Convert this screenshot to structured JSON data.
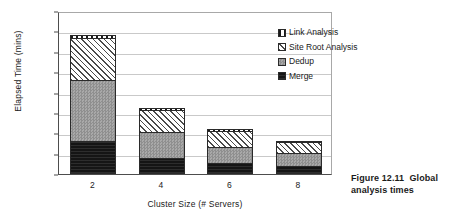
{
  "chart_data": {
    "type": "bar",
    "subtype": "stacked-bar",
    "title": "",
    "xlabel": "Cluster Size (# Servers)",
    "ylabel": "Elapsed Time (mins)",
    "categories": [
      "2",
      "4",
      "6",
      "8"
    ],
    "ylim": [
      0,
      400
    ],
    "yticks": [
      0,
      50,
      100,
      150,
      200,
      250,
      300,
      350,
      400
    ],
    "grid": true,
    "legend_position": "top-right-inside",
    "series": [
      {
        "name": "Merge",
        "values": [
          80,
          40,
          27,
          20
        ],
        "pattern": "solid-black",
        "color": "#151515"
      },
      {
        "name": "Dedup",
        "values": [
          151,
          63,
          40,
          32
        ],
        "pattern": "checker-gray",
        "color": "#9a9a9a"
      },
      {
        "name": "Site Root Analysis",
        "values": [
          102,
          55,
          38,
          26
        ],
        "pattern": "diagonal-hatch",
        "color": "#4a4a4a"
      },
      {
        "name": "Link Analysis",
        "values": [
          8,
          4,
          5,
          2
        ],
        "pattern": "vertical-stripes",
        "color": "#1a1a1a"
      }
    ],
    "totals": [
      341,
      162,
      110,
      80
    ],
    "legend_order": [
      "Link Analysis",
      "Site Root Analysis",
      "Dedup",
      "Merge"
    ]
  },
  "caption": {
    "number": "Figure 12.11",
    "text": "Global analysis times"
  }
}
